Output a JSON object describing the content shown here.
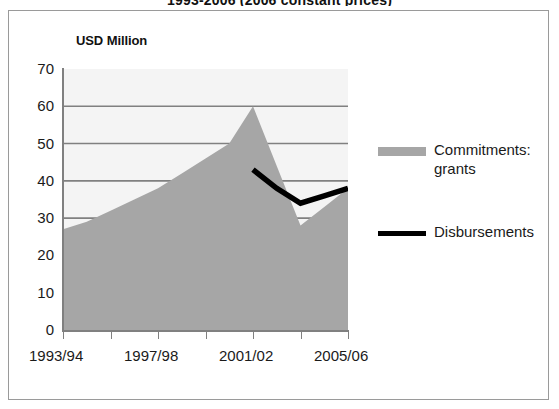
{
  "chart_title": "1993-2006 (2006 constant prices)",
  "axis_unit_label": "USD Million",
  "colors": {
    "area_fill": "#a6a6a6",
    "line": "#000000",
    "plot_background": "#f4f4f4",
    "gridline": "#808080",
    "frame_border": "#9a9a9a",
    "text": "#1a1a1a"
  },
  "legend": {
    "position": "right",
    "entries": [
      {
        "label": "Commitments: grants",
        "marker": "area-swatch",
        "color": "#a6a6a6"
      },
      {
        "label": "Disbursements",
        "marker": "line-swatch",
        "color": "#000000"
      }
    ]
  },
  "chart_data": {
    "type": "area",
    "title": "1993-2006 (2006 constant prices)",
    "subtitle": "",
    "xlabel": "",
    "ylabel": "USD Million",
    "ylim": [
      0,
      70
    ],
    "xlim": [
      0,
      12
    ],
    "ytick_values": [
      0,
      10,
      20,
      30,
      40,
      50,
      60,
      70
    ],
    "ytick_labels": [
      "0",
      "10",
      "20",
      "30",
      "40",
      "50",
      "60",
      "70"
    ],
    "grid": true,
    "grid_axis": "y",
    "gridline_values": [
      30,
      40,
      50,
      60
    ],
    "categories": [
      "1993/94",
      "1994/95",
      "1995/96",
      "1996/97",
      "1997/98",
      "1998/99",
      "1999/00",
      "2000/01",
      "2001/02",
      "2002/03",
      "2003/04",
      "2004/05",
      "2005/06"
    ],
    "xtick_labels_shown": [
      "1993/94",
      "1997/98",
      "2001/02",
      "2005/06"
    ],
    "xtick_label_indices": [
      0,
      4,
      8,
      12
    ],
    "series": [
      {
        "name": "Commitments: grants",
        "type": "area",
        "color": "#a6a6a6",
        "values": [
          27,
          29,
          32,
          35,
          38,
          42,
          46,
          50,
          60,
          44,
          28,
          33,
          38
        ]
      },
      {
        "name": "Disbursements",
        "type": "line",
        "color": "#000000",
        "x_start_index": 8,
        "values": [
          null,
          null,
          null,
          null,
          null,
          null,
          null,
          null,
          43,
          38,
          34,
          36,
          38
        ]
      }
    ]
  }
}
